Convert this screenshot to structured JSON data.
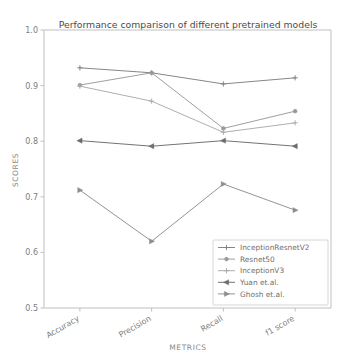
{
  "chart_data": {
    "type": "line",
    "title": "Performance comparison of different pretrained models",
    "xlabel": "METRICS",
    "ylabel": "SCORES",
    "categories": [
      "Accuracy",
      "Precision",
      "Recall",
      "f1 score"
    ],
    "ylim": [
      0.5,
      1.0
    ],
    "yticks": [
      "0.5",
      "0.6",
      "0.7",
      "0.8",
      "0.9",
      "1.0"
    ],
    "ytick_values": [
      0.5,
      0.6,
      0.7,
      0.8,
      0.9,
      1.0
    ],
    "grid": false,
    "legend_position": "lower right",
    "xtick_rotation": 30,
    "series": [
      {
        "name": "InceptionResnetV2",
        "values": [
          0.932,
          0.923,
          0.903,
          0.914
        ],
        "color": "#808080",
        "marker": "plus"
      },
      {
        "name": "Resnet50",
        "values": [
          0.901,
          0.923,
          0.823,
          0.854
        ],
        "color": "#9a9a9a",
        "marker": "circle"
      },
      {
        "name": "InceptionV3",
        "values": [
          0.899,
          0.872,
          0.816,
          0.833
        ],
        "color": "#aaaaaa",
        "marker": "plus"
      },
      {
        "name": "Yuan et.al.",
        "values": [
          0.801,
          0.791,
          0.801,
          0.791
        ],
        "color": "#6b6b6b",
        "marker": "triangle-left"
      },
      {
        "name": "Ghosh et.al.",
        "values": [
          0.712,
          0.62,
          0.723,
          0.676
        ],
        "color": "#8d8d8d",
        "marker": "triangle-right"
      }
    ]
  }
}
